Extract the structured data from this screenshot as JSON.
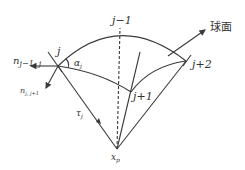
{
  "diagram": {
    "labels": {
      "j_minus_1": "j−1",
      "j": "j",
      "j_plus_1": "j+1",
      "j_plus_2": "j+2",
      "sphere": "球面",
      "n_prev": "n",
      "n_prev_sub": "j−1, j",
      "n_next": "n",
      "n_next_sub": "j, j+1",
      "alpha": "α",
      "alpha_sub": "j",
      "tau": "τ",
      "tau_sub": "j",
      "xp": "x",
      "xp_sub": "p"
    },
    "colors": {
      "stroke": "#3a3a3a",
      "text": "#333333",
      "background": "#ffffff"
    }
  }
}
